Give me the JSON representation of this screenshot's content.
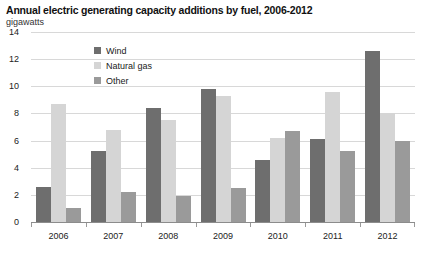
{
  "header": {
    "title": "Annual electric generating capacity additions by fuel, 2006-2012",
    "subtitle": "gigawatts"
  },
  "legend": {
    "position": "top-left-inside",
    "items": [
      {
        "label": "Wind",
        "color": "#6e6e6e"
      },
      {
        "label": "Natural gas",
        "color": "#d5d5d5"
      },
      {
        "label": "Other",
        "color": "#9a9a9a"
      }
    ]
  },
  "axes": {
    "y_ticks": [
      "14",
      "12",
      "10",
      "8",
      "6",
      "4",
      "2",
      "0"
    ],
    "x_ticks": [
      "2006",
      "2007",
      "2008",
      "2009",
      "2010",
      "2011",
      "2012"
    ]
  },
  "chart_data": {
    "type": "bar",
    "title": "Annual electric generating capacity additions by fuel, 2006-2012",
    "subtitle": "gigawatts",
    "xlabel": "",
    "ylabel": "gigawatts",
    "ylim": [
      0,
      14
    ],
    "ytick_step": 2,
    "grid": true,
    "legend_position": "upper left",
    "categories": [
      "2006",
      "2007",
      "2008",
      "2009",
      "2010",
      "2011",
      "2012"
    ],
    "series": [
      {
        "name": "Wind",
        "color": "#6e6e6e",
        "values": [
          2.6,
          5.2,
          8.4,
          9.8,
          4.6,
          6.1,
          12.6
        ]
      },
      {
        "name": "Natural gas",
        "color": "#d5d5d5",
        "values": [
          8.7,
          6.8,
          7.5,
          9.3,
          6.2,
          9.6,
          8.0
        ]
      },
      {
        "name": "Other",
        "color": "#9a9a9a",
        "values": [
          1.0,
          2.2,
          1.9,
          2.5,
          6.7,
          5.2,
          6.0
        ]
      }
    ]
  }
}
